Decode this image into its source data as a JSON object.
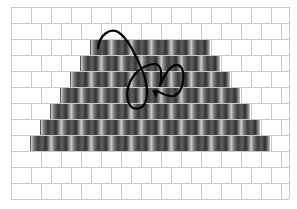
{
  "figure": {
    "grid": {
      "left": 11,
      "top": 7,
      "right": 289,
      "rows": 12,
      "row_height": 16,
      "brick_width": 20,
      "line_color": "#c8c8c8",
      "brick_fill": "#ffffff"
    },
    "pyramid": {
      "shade_colors": [
        "#d6d6d6",
        "#8a8a8a",
        "#3a3a3a",
        "#5a5a5a",
        "#2e2e2e",
        "#9a9a9a"
      ],
      "rows": [
        {
          "row": 2,
          "x_start": 90,
          "x_end": 210
        },
        {
          "row": 3,
          "x_start": 80,
          "x_end": 220
        },
        {
          "row": 4,
          "x_start": 70,
          "x_end": 230
        },
        {
          "row": 5,
          "x_start": 60,
          "x_end": 240
        },
        {
          "row": 6,
          "x_start": 50,
          "x_end": 250
        },
        {
          "row": 7,
          "x_start": 40,
          "x_end": 260
        },
        {
          "row": 8,
          "x_start": 30,
          "x_end": 270
        }
      ]
    },
    "path": {
      "stroke": "#000000",
      "stroke_width": 2.2,
      "d": "M98,48 C100,34 110,28 118,32 C128,38 136,56 142,70 C148,84 150,104 140,108 C128,112 124,96 130,82 C136,70 146,64 156,64 C162,66 162,76 160,86 C166,70 174,62 180,66 C186,72 184,92 174,96 C164,98 160,90 157,92",
      "arrowhead": {
        "x": 156,
        "y": 97,
        "direction": "down"
      }
    }
  }
}
